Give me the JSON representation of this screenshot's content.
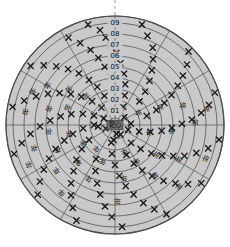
{
  "figure": {
    "type": "polar-target-scatter",
    "background_color": "#ffffff",
    "disc_fill": "#c9c9c9",
    "ring_stroke": "#4a4a4a",
    "spoke_stroke": "#4a4a4a",
    "marker_color": "#1a1a1a",
    "label_color": "#111111",
    "guide_line_color": "#9a9a9a",
    "center_x": 115,
    "center_y": 125,
    "outer_radius": 109
  },
  "guide": {
    "name": "north-guide-line",
    "style": "dashed",
    "x": 115,
    "y_top": 0,
    "y_bottom": 17
  },
  "center_label": {
    "text": "靶心",
    "x": 115,
    "y": 125
  },
  "ring_labels": [
    {
      "text": "09",
      "radius": 102
    },
    {
      "text": "08",
      "radius": 91
    },
    {
      "text": "07",
      "radius": 80
    },
    {
      "text": "06",
      "radius": 69
    },
    {
      "text": "05",
      "radius": 58
    },
    {
      "text": "04",
      "radius": 47
    },
    {
      "text": "03",
      "radius": 36
    },
    {
      "text": "02",
      "radius": 25
    },
    {
      "text": "01",
      "radius": 14
    }
  ],
  "rings": [
    109,
    102,
    91,
    80,
    69,
    58,
    47,
    36,
    25,
    14,
    7
  ],
  "spokes_deg": [
    0,
    30,
    60,
    90,
    120,
    150,
    180,
    210,
    240,
    270,
    300,
    330
  ],
  "chart_data": {
    "type": "scatter",
    "title": "",
    "xlabel": "",
    "ylabel": "",
    "coordinate_system": "polar",
    "r_range": [
      0,
      109
    ],
    "r_tick_labels": [
      "01",
      "02",
      "03",
      "04",
      "05",
      "06",
      "07",
      "08",
      "09"
    ],
    "r_ticks": [
      14,
      25,
      36,
      47,
      58,
      69,
      80,
      91,
      102
    ],
    "theta_ticks_deg": [
      0,
      30,
      60,
      90,
      120,
      150,
      180,
      210,
      240,
      270,
      300,
      330
    ],
    "grid": true,
    "legend": "none",
    "marker_symbol": "x",
    "points": [
      {
        "r": 104,
        "theta": 105
      },
      {
        "r": 96,
        "theta": 99
      },
      {
        "r": 88,
        "theta": 96
      },
      {
        "r": 80,
        "theta": 93
      },
      {
        "r": 72,
        "theta": 89
      },
      {
        "r": 62,
        "theta": 85
      },
      {
        "r": 52,
        "theta": 80
      },
      {
        "r": 42,
        "theta": 76
      },
      {
        "r": 31,
        "theta": 72
      },
      {
        "r": 20,
        "theta": 66
      },
      {
        "r": 104,
        "theta": 75
      },
      {
        "r": 95,
        "theta": 70
      },
      {
        "r": 86,
        "theta": 64
      },
      {
        "r": 76,
        "theta": 60
      },
      {
        "r": 66,
        "theta": 56
      },
      {
        "r": 56,
        "theta": 52
      },
      {
        "r": 45,
        "theta": 48
      },
      {
        "r": 34,
        "theta": 44
      },
      {
        "r": 104,
        "theta": 45
      },
      {
        "r": 94,
        "theta": 40
      },
      {
        "r": 84,
        "theta": 36
      },
      {
        "r": 74,
        "theta": 32
      },
      {
        "r": 64,
        "theta": 28
      },
      {
        "r": 54,
        "theta": 24
      },
      {
        "r": 44,
        "theta": 20
      },
      {
        "r": 33,
        "theta": 16
      },
      {
        "r": 105,
        "theta": 18
      },
      {
        "r": 96,
        "theta": 12
      },
      {
        "r": 87,
        "theta": 8
      },
      {
        "r": 77,
        "theta": 4
      },
      {
        "r": 67,
        "theta": 1
      },
      {
        "r": 57,
        "theta": -3
      },
      {
        "r": 47,
        "theta": -7
      },
      {
        "r": 36,
        "theta": -11
      },
      {
        "r": 25,
        "theta": -15
      },
      {
        "r": 14,
        "theta": -20
      },
      {
        "r": 105,
        "theta": -8
      },
      {
        "r": 96,
        "theta": -14
      },
      {
        "r": 86,
        "theta": -19
      },
      {
        "r": 76,
        "theta": -24
      },
      {
        "r": 66,
        "theta": -28
      },
      {
        "r": 56,
        "theta": -33
      },
      {
        "r": 46,
        "theta": -38
      },
      {
        "r": 35,
        "theta": -43
      },
      {
        "r": 24,
        "theta": -48
      },
      {
        "r": 104,
        "theta": -34
      },
      {
        "r": 94,
        "theta": -39
      },
      {
        "r": 84,
        "theta": -44
      },
      {
        "r": 74,
        "theta": -49
      },
      {
        "r": 63,
        "theta": -54
      },
      {
        "r": 53,
        "theta": -59
      },
      {
        "r": 43,
        "theta": -64
      },
      {
        "r": 32,
        "theta": -69
      },
      {
        "r": 103,
        "theta": -60
      },
      {
        "r": 93,
        "theta": -65
      },
      {
        "r": 83,
        "theta": -70
      },
      {
        "r": 72,
        "theta": -75
      },
      {
        "r": 62,
        "theta": -80
      },
      {
        "r": 51,
        "theta": -85
      },
      {
        "r": 40,
        "theta": -90
      },
      {
        "r": 29,
        "theta": -96
      },
      {
        "r": 18,
        "theta": -102
      },
      {
        "r": 102,
        "theta": -86
      },
      {
        "r": 92,
        "theta": -92
      },
      {
        "r": 82,
        "theta": -97
      },
      {
        "r": 71,
        "theta": -102
      },
      {
        "r": 61,
        "theta": -107
      },
      {
        "r": 50,
        "theta": -113
      },
      {
        "r": 39,
        "theta": -119
      },
      {
        "r": 103,
        "theta": -112
      },
      {
        "r": 93,
        "theta": -117
      },
      {
        "r": 83,
        "theta": -122
      },
      {
        "r": 73,
        "theta": -127
      },
      {
        "r": 62,
        "theta": -132
      },
      {
        "r": 52,
        "theta": -138
      },
      {
        "r": 41,
        "theta": -144
      },
      {
        "r": 30,
        "theta": -150
      },
      {
        "r": 104,
        "theta": -138
      },
      {
        "r": 94,
        "theta": -143
      },
      {
        "r": 84,
        "theta": -148
      },
      {
        "r": 74,
        "theta": -153
      },
      {
        "r": 64,
        "theta": -158
      },
      {
        "r": 53,
        "theta": -163
      },
      {
        "r": 43,
        "theta": -168
      },
      {
        "r": 32,
        "theta": -174
      },
      {
        "r": 21,
        "theta": -180
      },
      {
        "r": 105,
        "theta": -164
      },
      {
        "r": 95,
        "theta": -169
      },
      {
        "r": 85,
        "theta": -174
      },
      {
        "r": 75,
        "theta": -179
      },
      {
        "r": 65,
        "theta": 176
      },
      {
        "r": 55,
        "theta": 171
      },
      {
        "r": 45,
        "theta": 166
      },
      {
        "r": 34,
        "theta": 161
      },
      {
        "r": 23,
        "theta": 156
      },
      {
        "r": 13,
        "theta": 150
      },
      {
        "r": 104,
        "theta": 170
      },
      {
        "r": 94,
        "theta": 165
      },
      {
        "r": 84,
        "theta": 160
      },
      {
        "r": 74,
        "theta": 155
      },
      {
        "r": 64,
        "theta": 150
      },
      {
        "r": 54,
        "theta": 145
      },
      {
        "r": 44,
        "theta": 140
      },
      {
        "r": 33,
        "theta": 134
      },
      {
        "r": 22,
        "theta": 128
      },
      {
        "r": 103,
        "theta": 145
      },
      {
        "r": 93,
        "theta": 140
      },
      {
        "r": 83,
        "theta": 135
      },
      {
        "r": 73,
        "theta": 130
      },
      {
        "r": 63,
        "theta": 125
      },
      {
        "r": 52,
        "theta": 120
      },
      {
        "r": 42,
        "theta": 115
      },
      {
        "r": 31,
        "theta": 110
      },
      {
        "r": 99,
        "theta": 118
      },
      {
        "r": 89,
        "theta": 113
      },
      {
        "r": 79,
        "theta": 108
      },
      {
        "r": 69,
        "theta": 104
      },
      {
        "r": 59,
        "theta": 100
      },
      {
        "r": 48,
        "theta": 95
      },
      {
        "r": 12,
        "theta": 40
      },
      {
        "r": 11,
        "theta": -60
      },
      {
        "r": 10,
        "theta": 200
      },
      {
        "r": 9,
        "theta": 280
      },
      {
        "r": 16,
        "theta": 5
      },
      {
        "r": 17,
        "theta": 185
      },
      {
        "r": 15,
        "theta": 95
      },
      {
        "r": 15,
        "theta": 265
      }
    ],
    "cjk_annotations": [
      {
        "text": "年",
        "r": 90,
        "theta": 172
      },
      {
        "text": "年",
        "r": 68,
        "theta": 166
      },
      {
        "text": "年",
        "r": 50,
        "theta": 160
      },
      {
        "text": "年",
        "r": 78,
        "theta": 150
      },
      {
        "text": "年",
        "r": 58,
        "theta": 143
      },
      {
        "text": "年",
        "r": 40,
        "theta": 136
      },
      {
        "text": "年",
        "r": 88,
        "theta": 158
      },
      {
        "text": "年",
        "r": 66,
        "theta": 186
      },
      {
        "text": "年",
        "r": 46,
        "theta": 192
      },
      {
        "text": "年",
        "r": 84,
        "theta": 196
      },
      {
        "text": "年",
        "r": 62,
        "theta": 204
      },
      {
        "text": "年",
        "r": 36,
        "theta": 210
      },
      {
        "text": "年",
        "r": 95,
        "theta": 205
      },
      {
        "text": "年",
        "r": 74,
        "theta": 218
      },
      {
        "text": "年",
        "r": 52,
        "theta": 226
      },
      {
        "text": "年",
        "r": 30,
        "theta": 232
      },
      {
        "text": "年",
        "r": 86,
        "theta": 232
      },
      {
        "text": "年",
        "r": 60,
        "theta": 244
      },
      {
        "text": "年",
        "r": 38,
        "theta": 252
      },
      {
        "text": "年",
        "r": 92,
        "theta": 10
      },
      {
        "text": "年",
        "r": 70,
        "theta": 16
      },
      {
        "text": "年",
        "r": 48,
        "theta": 22
      },
      {
        "text": "年",
        "r": 26,
        "theta": 28
      },
      {
        "text": "年",
        "r": 80,
        "theta": 2
      },
      {
        "text": "年",
        "r": 56,
        "theta": -6
      },
      {
        "text": "年",
        "r": 34,
        "theta": -12
      },
      {
        "text": "年",
        "r": 96,
        "theta": -20
      },
      {
        "text": "年",
        "r": 72,
        "theta": -28
      },
      {
        "text": "年",
        "r": 50,
        "theta": -36
      },
      {
        "text": "年",
        "r": 88,
        "theta": -44
      },
      {
        "text": "年",
        "r": 64,
        "theta": -52
      },
      {
        "text": "年",
        "r": 42,
        "theta": -60
      },
      {
        "text": "年",
        "r": 76,
        "theta": 272
      },
      {
        "text": "年",
        "r": 54,
        "theta": 280
      },
      {
        "text": "年",
        "r": 28,
        "theta": 290
      }
    ]
  }
}
